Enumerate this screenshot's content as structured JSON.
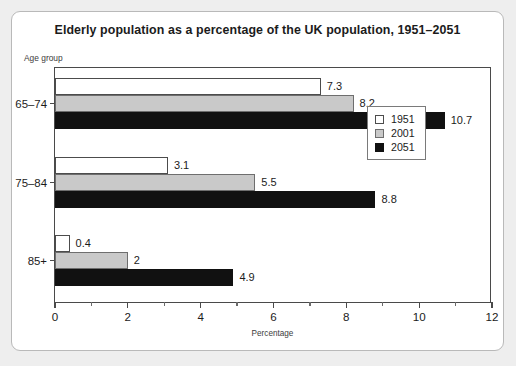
{
  "card": {
    "title": "Elderly population as a percentage of the UK population, 1951–2051"
  },
  "chart_data": {
    "type": "bar",
    "orientation": "horizontal",
    "title": "Elderly population as a percentage of the UK population, 1951–2051",
    "categories": [
      "65–74",
      "75–84",
      "85+"
    ],
    "series": [
      {
        "name": "1951",
        "color": "#ffffff",
        "values": [
          7.3,
          3.1,
          0.4
        ],
        "labels": [
          "7.3",
          "3.1",
          "0.4"
        ]
      },
      {
        "name": "2001",
        "color": "#c9c9c9",
        "values": [
          8.2,
          5.5,
          2.0
        ],
        "labels": [
          "8.2",
          "5.5",
          "2"
        ]
      },
      {
        "name": "2051",
        "color": "#111111",
        "values": [
          10.7,
          8.8,
          4.9
        ],
        "labels": [
          "10.7",
          "8.8",
          "4.9"
        ]
      }
    ],
    "xlabel": "Percentage",
    "ylabel": "Age group",
    "xlim": [
      0,
      12
    ],
    "xticks": [
      0,
      2,
      4,
      6,
      8,
      10,
      12
    ],
    "xtick_labels": [
      "0",
      "2",
      "4",
      "6",
      "8",
      "10",
      "12"
    ],
    "xminor_ticks": [
      1,
      3,
      5,
      7,
      9,
      11
    ],
    "grid": false,
    "legend_position": "center-right",
    "legend_entries": [
      "1951",
      "2001",
      "2051"
    ]
  }
}
